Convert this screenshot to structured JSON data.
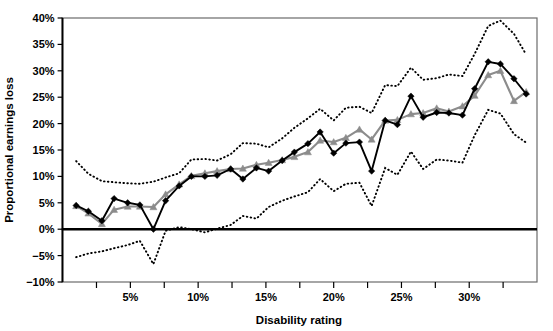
{
  "chart_data": {
    "type": "line",
    "title": "",
    "xlabel": "Disability rating",
    "ylabel": "Proportional earnings loss",
    "xlim": [
      0,
      35
    ],
    "ylim": [
      -10,
      40
    ],
    "xtick_labels": [
      "5%",
      "10%",
      "15%",
      "20%",
      "25%",
      "30%"
    ],
    "xtick_values": [
      5,
      10,
      15,
      20,
      25,
      30
    ],
    "xminor_values": [
      2.5,
      7.5,
      12.5,
      17.5,
      22.5,
      27.5,
      32.5
    ],
    "ytick_labels": [
      "-10%",
      "-5%",
      "0%",
      "5%",
      "10%",
      "15%",
      "20%",
      "25%",
      "30%",
      "35%",
      "40%"
    ],
    "ytick_values": [
      -10,
      -5,
      0,
      5,
      10,
      15,
      20,
      25,
      30,
      35,
      40
    ],
    "grid": false,
    "legend_position": "none",
    "zero_line": 0,
    "x": [
      1.0,
      1.9,
      2.9,
      3.8,
      4.8,
      5.7,
      6.7,
      7.6,
      8.6,
      9.5,
      10.5,
      11.4,
      12.4,
      13.3,
      14.3,
      15.2,
      16.2,
      17.1,
      18.1,
      19.0,
      20.0,
      20.9,
      21.9,
      22.8,
      23.8,
      24.7,
      25.7,
      26.6,
      27.6,
      28.5,
      29.5,
      30.4,
      31.4,
      32.3,
      33.3,
      34.2
    ],
    "series": [
      {
        "name": "Estimate (black diamonds)",
        "marker": "diamond",
        "color": "#000000",
        "values": [
          4.5,
          3.4,
          1.6,
          5.8,
          5.0,
          4.6,
          0.0,
          5.4,
          8.2,
          10.0,
          10.0,
          10.2,
          11.4,
          9.5,
          11.6,
          11.0,
          13.0,
          14.6,
          16.2,
          18.4,
          14.4,
          16.3,
          16.5,
          11.0,
          20.6,
          19.8,
          25.2,
          21.2,
          22.1,
          22.0,
          21.6,
          26.6,
          31.7,
          31.3,
          28.5,
          25.6
        ]
      },
      {
        "name": "Comparison (gray triangles)",
        "marker": "triangle",
        "color": "#8c8c8c",
        "values": [
          4.4,
          3.0,
          1.0,
          3.7,
          4.3,
          4.3,
          4.2,
          6.6,
          8.5,
          10.1,
          10.6,
          11.0,
          11.4,
          11.5,
          12.2,
          12.6,
          13.1,
          13.7,
          14.6,
          16.8,
          16.5,
          17.3,
          18.9,
          17.0,
          20.6,
          20.7,
          21.8,
          22.0,
          22.9,
          22.3,
          23.3,
          25.3,
          29.2,
          30.0,
          24.3,
          26.0
        ]
      },
      {
        "name": "Upper confidence bound",
        "marker": "none",
        "style": "dotted",
        "color": "#000000",
        "values": [
          12.9,
          10.5,
          9.1,
          8.9,
          8.7,
          8.6,
          9.0,
          9.8,
          10.6,
          13.2,
          13.3,
          13.0,
          14.2,
          16.3,
          16.2,
          15.5,
          17.2,
          19.2,
          21.0,
          22.8,
          20.6,
          23.0,
          23.2,
          22.0,
          27.3,
          27.1,
          30.6,
          28.3,
          28.6,
          29.3,
          29.0,
          33.2,
          38.5,
          39.5,
          37.0,
          33.1
        ]
      },
      {
        "name": "Lower confidence bound",
        "marker": "none",
        "style": "dotted",
        "color": "#000000",
        "values": [
          -5.3,
          -4.6,
          -4.2,
          -3.6,
          -3.0,
          -2.2,
          -6.6,
          -0.3,
          0.4,
          0.0,
          -0.6,
          0.1,
          0.8,
          2.5,
          2.0,
          4.2,
          5.4,
          6.2,
          7.0,
          9.5,
          7.2,
          8.6,
          8.8,
          4.4,
          11.6,
          10.3,
          14.7,
          11.4,
          13.2,
          13.0,
          12.6,
          17.8,
          22.6,
          21.9,
          18.0,
          16.4
        ]
      }
    ]
  },
  "axes": {
    "x_title": "Disability rating",
    "y_title": "Proportional earnings loss"
  }
}
